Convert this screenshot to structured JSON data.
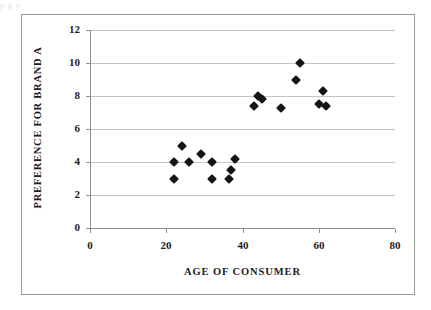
{
  "scan": {
    "top_text_fragment": "p                                                                        g                                    y"
  },
  "chart_data": {
    "type": "scatter",
    "title": "",
    "xlabel": "AGE OF CONSUMER",
    "ylabel": "PREFERENCE FOR BRAND A",
    "xlim": [
      0,
      80
    ],
    "ylim": [
      0,
      12
    ],
    "xticks": [
      0,
      20,
      40,
      60,
      80
    ],
    "yticks": [
      0,
      2,
      4,
      6,
      8,
      10,
      12
    ],
    "xtick_labels": [
      "0",
      "20",
      "40",
      "60",
      "80"
    ],
    "ytick_labels": [
      "0",
      "2",
      "4",
      "6",
      "8",
      "10",
      "12"
    ],
    "grid": "horizontal",
    "legend": "none",
    "marker": "diamond",
    "marker_color": "#151515",
    "series": [
      {
        "name": "Consumers",
        "points": [
          {
            "x": 22,
            "y": 4.0
          },
          {
            "x": 22,
            "y": 3.0
          },
          {
            "x": 24,
            "y": 5.0
          },
          {
            "x": 26,
            "y": 4.0
          },
          {
            "x": 29,
            "y": 4.5
          },
          {
            "x": 32,
            "y": 4.0
          },
          {
            "x": 32,
            "y": 3.0
          },
          {
            "x": 36.5,
            "y": 3.0
          },
          {
            "x": 37,
            "y": 3.5
          },
          {
            "x": 38,
            "y": 4.2
          },
          {
            "x": 43,
            "y": 7.4
          },
          {
            "x": 44,
            "y": 8.0
          },
          {
            "x": 45,
            "y": 7.8
          },
          {
            "x": 50,
            "y": 7.3
          },
          {
            "x": 54,
            "y": 9.0
          },
          {
            "x": 55,
            "y": 10.0
          },
          {
            "x": 60,
            "y": 7.5
          },
          {
            "x": 61,
            "y": 8.3
          },
          {
            "x": 62,
            "y": 7.4
          }
        ]
      }
    ]
  }
}
